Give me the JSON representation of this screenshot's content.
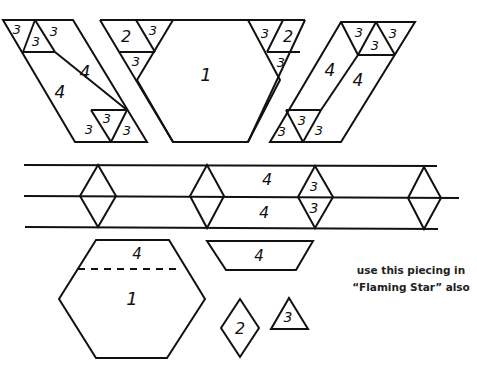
{
  "diagram": {
    "top_row": {
      "left_parallelogram": {
        "top_triangles": [
          "3",
          "3",
          "3"
        ],
        "strips": [
          "4",
          "4"
        ],
        "bottom_triangles": [
          "3",
          "3",
          "3"
        ]
      },
      "center_block": {
        "left_corner": {
          "diamond": "2",
          "triangles": [
            "3",
            "3"
          ]
        },
        "hexagon": "1",
        "right_corner": {
          "diamond": "2",
          "triangles": [
            "3",
            "3"
          ]
        }
      },
      "right_parallelogram": {
        "top_triangles": [
          "3",
          "3",
          "3"
        ],
        "strips": [
          "4",
          "4"
        ],
        "bottom_triangles": [
          "3",
          "3",
          "3"
        ]
      }
    },
    "middle_band": {
      "strip_top": "4",
      "strip_bottom": "4",
      "labeled_diamond": {
        "top": "3",
        "bottom": "3"
      },
      "diamond_count": 4
    },
    "templates": {
      "hexagon": {
        "top_section": "4",
        "body": "1"
      },
      "trapezoid": "4",
      "diamond": "2",
      "triangle": "3"
    },
    "note": {
      "line1": "use this piecing in",
      "line2": "“Flaming Star” also"
    }
  }
}
